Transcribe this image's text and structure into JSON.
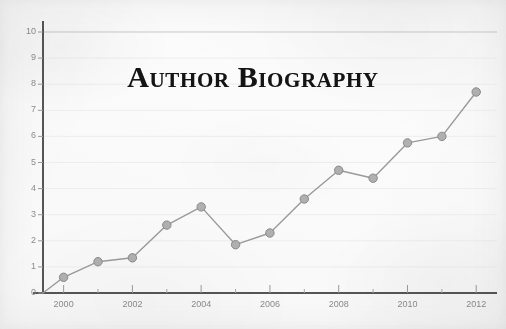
{
  "chart_data": {
    "type": "line",
    "title": "Author Biography",
    "xlabel": "",
    "ylabel": "",
    "x": [
      2000,
      2001,
      2002,
      2003,
      2004,
      2005,
      2006,
      2007,
      2008,
      2009,
      2010,
      2011,
      2012
    ],
    "values": [
      0.6,
      1.2,
      1.35,
      2.6,
      3.3,
      1.85,
      2.3,
      3.6,
      4.7,
      4.4,
      5.75,
      6.0,
      7.7
    ],
    "series": [
      {
        "name": "Author Biography",
        "values": [
          0.6,
          1.2,
          1.35,
          2.6,
          3.3,
          1.85,
          2.3,
          3.6,
          4.7,
          4.4,
          5.75,
          6.0,
          7.7
        ]
      }
    ],
    "xlim": [
      1999.4,
      2012.4
    ],
    "ylim": [
      0,
      10
    ],
    "yticks": [
      0,
      1,
      2,
      3,
      4,
      5,
      6,
      7,
      8,
      9,
      10
    ],
    "ytick_labels": [
      "0",
      "1",
      "2",
      "3",
      "4",
      "5",
      "6",
      "7",
      "8",
      "9",
      "10"
    ],
    "xticks_major": [
      2000,
      2002,
      2004,
      2006,
      2008,
      2010,
      2012
    ],
    "xtick_labels": [
      "2000",
      "2002",
      "2004",
      "2006",
      "2008",
      "2010",
      "2012"
    ],
    "xticks_minor": [
      2001,
      2003,
      2005,
      2007,
      2009,
      2011
    ],
    "grid": "horizontal",
    "legend": "none",
    "colors": {
      "line": "#9a9a9a",
      "marker_fill": "#b0b0b0",
      "marker_edge": "#8a8a8a",
      "gridline": "#ededed",
      "axis": "#555555",
      "tick_label": "#8c8c8c",
      "title": "#141414",
      "background": "#fbfbfb"
    }
  }
}
